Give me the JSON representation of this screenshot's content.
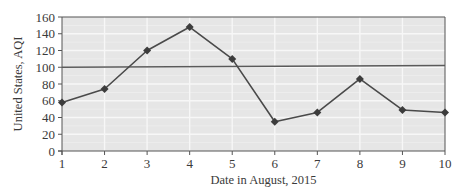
{
  "chart_data": {
    "type": "line",
    "title": "",
    "xlabel": "Date in August, 2015",
    "ylabel": "United States, AQI",
    "x": [
      1,
      2,
      3,
      4,
      5,
      6,
      7,
      8,
      9,
      10
    ],
    "categories": [
      "1",
      "2",
      "3",
      "4",
      "5",
      "6",
      "7",
      "8",
      "9",
      "10"
    ],
    "series": [
      {
        "name": "AQI",
        "values": [
          58,
          74,
          120,
          148,
          110,
          35,
          46,
          86,
          49,
          46
        ],
        "marker": "diamond",
        "color": "#4a4a4a"
      }
    ],
    "reference_lines": [
      {
        "name": "AQI threshold",
        "y": 100,
        "y_end": 102,
        "color": "#5a5a5a"
      }
    ],
    "xlim": [
      1,
      10
    ],
    "ylim": [
      0,
      160
    ],
    "yticks": [
      0,
      20,
      40,
      60,
      80,
      100,
      120,
      140,
      160
    ],
    "xticks": [
      1,
      2,
      3,
      4,
      5,
      6,
      7,
      8,
      9,
      10
    ],
    "grid": true,
    "legend": null
  },
  "style": {
    "plot_bg": "#e6e6e6",
    "grid_color": "#f7f7f7",
    "axis_color": "#555555",
    "line_color": "#4a4a4a",
    "marker_color": "#3c3c3c",
    "ref_line_color": "#5a5a5a"
  }
}
